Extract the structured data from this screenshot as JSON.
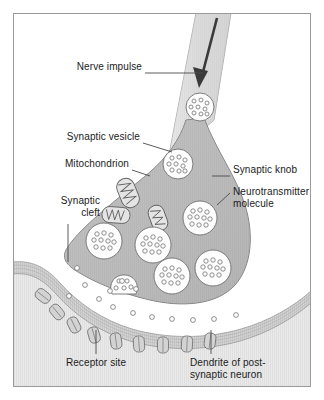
{
  "figure": {
    "border_color": "#9a9a9a",
    "background_color": "#ffffff"
  },
  "colors": {
    "knob_fill": "#b9b9b9",
    "knob_stroke": "#6f6f6f",
    "axon_fill": "#d8d8d8",
    "vesicle_fill": "#fdfdfd",
    "vesicle_stroke": "#6f6f6f",
    "molecule_stroke": "#7b7b7b",
    "mitochondrion_fill": "#e2e2e2",
    "membrane_fill": "#cfcfcf",
    "dendrite_fill": "#e6e6e6",
    "arrow_color": "#3a3a3a",
    "leader_color": "#4a4a4a",
    "text_color": "#1b1b1b"
  },
  "labels": [
    {
      "id": "nerve-impulse",
      "text": "Nerve impulse",
      "x": 78,
      "y": 67,
      "align": "left"
    },
    {
      "id": "synaptic-vesicle",
      "text": "Synaptic vesicle",
      "x": 48,
      "y": 137,
      "align": "left"
    },
    {
      "id": "mitochondrion",
      "text": "Mitochondrion",
      "x": 52,
      "y": 164,
      "align": "left"
    },
    {
      "id": "synaptic-knob",
      "text": "Synaptic knob",
      "x": 232,
      "y": 170,
      "align": "left"
    },
    {
      "id": "synaptic-cleft",
      "text": "Synaptic\ncleft",
      "x": 36,
      "y": 200,
      "align": "left"
    },
    {
      "id": "receptor-site",
      "text": "Receptor site",
      "x": 81,
      "y": 356,
      "align": "left"
    },
    {
      "id": "dendrite",
      "text": "Dendrite of post-\nsynaptic neuron",
      "x": 191,
      "y": 356,
      "align": "left"
    }
  ],
  "label_text": {
    "nerve_impulse": "Nerve impulse",
    "synaptic_vesicle": "Synaptic vesicle",
    "mitochondrion": "Mitochondrion",
    "synaptic_knob": "Synaptic knob",
    "neurotransmitter_line1": "Neurotransmitter",
    "neurotransmitter_line2": "molecule",
    "synaptic_cleft_line1": "Synaptic",
    "synaptic_cleft_line2": "cleft",
    "receptor_site": "Receptor site",
    "dendrite_line1": "Dendrite of post-",
    "dendrite_line2": "synaptic neuron"
  },
  "structures": {
    "vesicles": [
      {
        "id": "vesicle-axon",
        "cx": 200,
        "cy": 107,
        "r": 14
      },
      {
        "id": "vesicle-upper",
        "cx": 178,
        "cy": 164,
        "r": 15
      },
      {
        "id": "vesicle-right",
        "cx": 200,
        "cy": 218,
        "r": 17
      },
      {
        "id": "vesicle-left",
        "cx": 104,
        "cy": 241,
        "r": 18
      },
      {
        "id": "vesicle-mid",
        "cx": 153,
        "cy": 245,
        "r": 18
      },
      {
        "id": "vesicle-low",
        "cx": 172,
        "cy": 276,
        "r": 18
      },
      {
        "id": "vesicle-far",
        "cx": 213,
        "cy": 268,
        "r": 18
      },
      {
        "id": "vesicle-fusing",
        "cx": 124,
        "cy": 288,
        "r": 13
      }
    ],
    "mitochondria": [
      {
        "id": "mito-upper",
        "cx": 128,
        "cy": 193,
        "rot": -22
      },
      {
        "id": "mito-left",
        "cx": 116,
        "cy": 215,
        "rot": 4
      },
      {
        "id": "mito-mid",
        "cx": 158,
        "cy": 218,
        "rot": -20
      }
    ],
    "cleft_molecules": [
      {
        "cx": 77,
        "cy": 268
      },
      {
        "cx": 85,
        "cy": 285
      },
      {
        "cx": 69,
        "cy": 296
      },
      {
        "cx": 99,
        "cy": 299
      },
      {
        "cx": 113,
        "cy": 307
      },
      {
        "cx": 133,
        "cy": 313
      },
      {
        "cx": 152,
        "cy": 317
      },
      {
        "cx": 172,
        "cy": 319
      },
      {
        "cx": 193,
        "cy": 320
      },
      {
        "cx": 214,
        "cy": 319
      },
      {
        "cx": 236,
        "cy": 315
      },
      {
        "cx": 122,
        "cy": 281
      },
      {
        "cx": 136,
        "cy": 289
      },
      {
        "cx": 110,
        "cy": 291
      }
    ],
    "receptors": [
      {
        "cx": 43,
        "cy": 296,
        "rot": -52
      },
      {
        "cx": 57,
        "cy": 312,
        "rot": -40
      },
      {
        "cx": 74,
        "cy": 325,
        "rot": -26
      },
      {
        "cx": 94,
        "cy": 335,
        "rot": -16
      },
      {
        "cx": 116,
        "cy": 341,
        "rot": -8
      },
      {
        "cx": 139,
        "cy": 344,
        "rot": -4
      },
      {
        "cx": 163,
        "cy": 345,
        "rot": 0
      },
      {
        "cx": 187,
        "cy": 344,
        "rot": 3
      },
      {
        "cx": 210,
        "cy": 341,
        "rot": 7
      }
    ]
  },
  "arrow": {
    "label": "nerve impulse direction",
    "direction": "down-left"
  }
}
